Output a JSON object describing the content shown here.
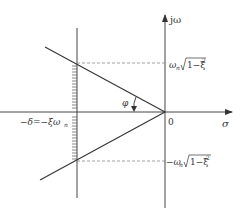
{
  "diagram": {
    "type": "s-plane damping region",
    "axes": {
      "imag_label": "jω",
      "real_label": "σ",
      "origin_label": "0"
    },
    "labels": {
      "upper_freq": "ωₙ√1−ξ²",
      "upper_freq_base": "ω",
      "upper_freq_sub": "n",
      "upper_freq_root": "1−ξ",
      "upper_freq_sup": "2",
      "lower_freq_base": "−ω",
      "lower_freq_sub": "n",
      "lower_freq_root": "1−ξ",
      "lower_freq_sup": "2",
      "delta_label": "−δ=−ξωₙ",
      "delta_text": "−δ=−ξω",
      "delta_sub": "n",
      "angle_label": "φ"
    },
    "colors": {
      "line": "#333333",
      "dashed": "#777777",
      "background": "#ffffff"
    }
  }
}
